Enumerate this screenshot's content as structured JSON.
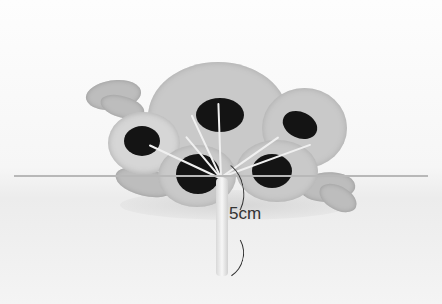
{
  "image": {
    "description": "Grayscale photo of a crocheted bouquet of five flowers with dark centers and leaves, tied by a wrapped stem",
    "annotation": {
      "label": "5cm",
      "color": "#333333"
    },
    "colors": {
      "background": "#fbfbfb",
      "petals": "#c9c9c9",
      "centers": "#141414",
      "horizon_line": "#b8b8b8"
    }
  }
}
